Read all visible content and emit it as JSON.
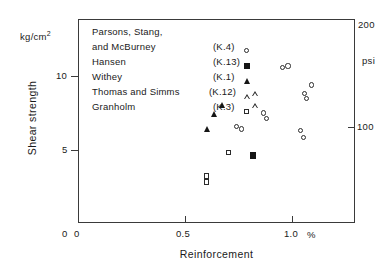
{
  "chart_data": {
    "type": "scatter",
    "title": "",
    "xlabel": "Reinforcement",
    "ylabel": "Shear strength",
    "x_unit": "%",
    "y_unit": "kg/cm2",
    "y_unit_display": "kg/cm",
    "y_unit_exponent": "2",
    "right_axis_unit": "psi",
    "xlim": [
      0,
      1.295
    ],
    "ylim": [
      0,
      13.9
    ],
    "xticks": [
      0,
      0.5,
      1.0
    ],
    "xticklabels": [
      "0",
      "0.5",
      "1.0"
    ],
    "yticks": [
      0,
      5,
      10
    ],
    "yticklabels": [
      "0",
      "5",
      "10"
    ],
    "right_ticks": [
      100,
      200
    ],
    "right_ticklabels": [
      "100",
      "200"
    ],
    "grid": false,
    "legend_position": "upper-left-inside",
    "series": [
      {
        "name": "Parsons, Stang, and McBurney",
        "reference": "(K.4)",
        "marker": "open-circle",
        "points": [
          {
            "x": 0.955,
            "y": 10.6
          },
          {
            "x": 0.982,
            "y": 10.7
          },
          {
            "x": 1.092,
            "y": 9.4
          },
          {
            "x": 1.06,
            "y": 8.8
          },
          {
            "x": 1.068,
            "y": 8.5
          },
          {
            "x": 0.868,
            "y": 7.5
          },
          {
            "x": 0.88,
            "y": 7.1
          },
          {
            "x": 0.742,
            "y": 6.6
          },
          {
            "x": 0.765,
            "y": 6.4
          },
          {
            "x": 1.04,
            "y": 6.3
          },
          {
            "x": 1.055,
            "y": 5.8
          }
        ]
      },
      {
        "name": "Hansen",
        "reference": "(K.13)",
        "marker": "filled-square",
        "points": [
          {
            "x": 0.82,
            "y": 4.6
          }
        ]
      },
      {
        "name": "Withey",
        "reference": "(K.1)",
        "marker": "filled-triangle",
        "points": [
          {
            "x": 0.675,
            "y": 8.0
          },
          {
            "x": 0.64,
            "y": 7.4
          },
          {
            "x": 0.605,
            "y": 6.4
          }
        ]
      },
      {
        "name": "Thomas and Simms",
        "reference": "(K.12)",
        "marker": "open-triangle",
        "points": [
          {
            "x": 0.828,
            "y": 8.8
          },
          {
            "x": 0.83,
            "y": 8.3
          }
        ]
      },
      {
        "name": "Granholm",
        "reference": "(K.3)",
        "marker": "open-square",
        "points": [
          {
            "x": 0.705,
            "y": 4.8
          },
          {
            "x": 0.6,
            "y": 3.2
          },
          {
            "x": 0.6,
            "y": 2.8
          }
        ]
      }
    ]
  },
  "axes": {
    "y_unit_prefix": "kg/cm",
    "y_unit_sup": "2",
    "y_title": "Shear strength",
    "x_title": "Reinforcement",
    "x_unit": "%",
    "right_unit": "psi",
    "right_top": "200",
    "right_hundred": "100",
    "ytick_10": "10",
    "ytick_5": "5",
    "ytick_0": "0",
    "xtick_0": "0",
    "xtick_05": "0.5",
    "xtick_10": "1.0"
  },
  "legend": {
    "rows": [
      {
        "name": "Parsons, Stang,",
        "name2": "and McBurney",
        "reference": "(K.4)",
        "marker": "open-circle"
      },
      {
        "name": "Hansen",
        "reference": "(K.13)",
        "marker": "filled-square"
      },
      {
        "name": "Withey",
        "reference": "(K.1)",
        "marker": "filled-triangle"
      },
      {
        "name": "Thomas and Simms",
        "reference": "(K.12)",
        "marker": "open-triangle"
      },
      {
        "name": "Granholm",
        "reference": "(K.3)",
        "marker": "open-square"
      }
    ]
  },
  "colors": {
    "frame": "#3a3a3a",
    "marker": "#2b2b2b",
    "marker_filled": "#151515",
    "text": "#1a1a1a",
    "background": "#ffffff"
  }
}
